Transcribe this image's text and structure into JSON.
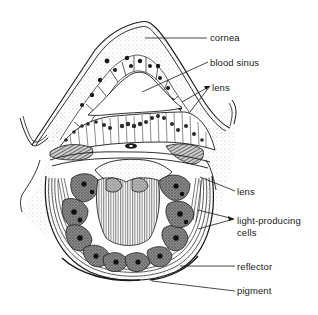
{
  "figure": {
    "labels": [
      {
        "id": "cornea",
        "text": "cornea"
      },
      {
        "id": "blood-sinus",
        "text": "blood sinus"
      },
      {
        "id": "lens-upper",
        "text": "lens"
      },
      {
        "id": "lens-lower",
        "text": "lens"
      },
      {
        "id": "light-producing-cells",
        "text": "light-producing",
        "text2": "cells"
      },
      {
        "id": "reflector",
        "text": "reflector"
      },
      {
        "id": "pigment",
        "text": "pigment"
      }
    ],
    "colors": {
      "ink": "#1a1a1a",
      "background": "#ffffff",
      "stipple": "#9a9a9a",
      "cell_fill": "#6e6e6e"
    }
  }
}
